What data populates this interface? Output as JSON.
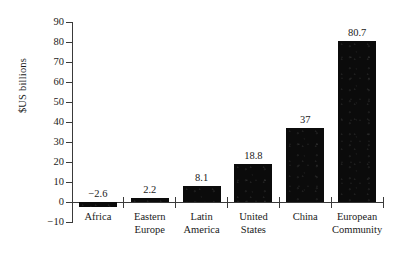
{
  "chart_data": {
    "type": "bar",
    "title": "",
    "xlabel": "",
    "ylabel": "$US billions",
    "categories": [
      "Africa",
      "Eastern Europe",
      "Latin America",
      "United States",
      "China",
      "European Community"
    ],
    "category_lines": [
      [
        "Africa"
      ],
      [
        "Eastern",
        "Europe"
      ],
      [
        "Latin",
        "America"
      ],
      [
        "United",
        "States"
      ],
      [
        "China"
      ],
      [
        "European",
        "Community"
      ]
    ],
    "values": [
      -2.6,
      2.2,
      8.1,
      18.8,
      37,
      80.7
    ],
    "value_labels": [
      "−2.6",
      "2.2",
      "8.1",
      "18.8",
      "37",
      "80.7"
    ],
    "ylim": [
      -10,
      90
    ],
    "yticks": [
      90,
      80,
      70,
      60,
      50,
      40,
      30,
      20,
      10,
      0,
      -10
    ],
    "ytick_labels": [
      "90",
      "80",
      "70",
      "60",
      "50",
      "40",
      "30",
      "20",
      "10",
      "0",
      "−10"
    ],
    "grid": false,
    "legend": null,
    "bar_color": "#0b0b0b",
    "axis_color": "#3a3a3a",
    "background_color": "#ffffff"
  }
}
